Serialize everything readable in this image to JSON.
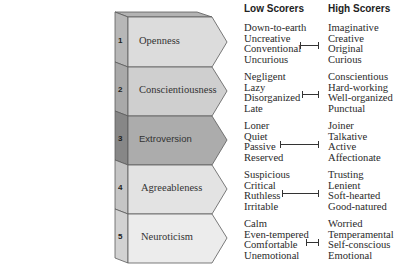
{
  "headers": {
    "low": "Low Scorers",
    "high": "High Scorers"
  },
  "traits": [
    {
      "number": "1",
      "name": "Openness",
      "fill": "#dcdcdc",
      "side": "#b7b7b7",
      "low": [
        "Down-to-earth",
        "Uncreative",
        "Conventional",
        "Uncurious"
      ],
      "high": [
        "Imaginative",
        "Creative",
        "Original",
        "Curious"
      ]
    },
    {
      "number": "2",
      "name": "Conscientiousness",
      "fill": "#cfcfcf",
      "side": "#a9a9a9",
      "low": [
        "Negligent",
        "Lazy",
        "Disorganized",
        "Late"
      ],
      "high": [
        "Conscientious",
        "Hard-working",
        "Well-organized",
        "Punctual"
      ]
    },
    {
      "number": "3",
      "name": "Extroversion",
      "fill": "#acacac",
      "side": "#878787",
      "low": [
        "Loner",
        "Quiet",
        "Passive",
        "Reserved"
      ],
      "high": [
        "Joiner",
        "Talkative",
        "Active",
        "Affectionate"
      ]
    },
    {
      "number": "4",
      "name": "Agreeableness",
      "fill": "#e3e3e3",
      "side": "#c5c5c5",
      "low": [
        "Suspicious",
        "Critical",
        "Ruthless",
        "Irritable"
      ],
      "high": [
        "Trusting",
        "Lenient",
        "Soft-hearted",
        "Good-natured"
      ]
    },
    {
      "number": "5",
      "name": "Neuroticism",
      "fill": "#ececec",
      "side": "#d2d2d2",
      "low": [
        "Calm",
        "Even-tempered",
        "Comfortable",
        "Unemotional"
      ],
      "high": [
        "Worried",
        "Temperamental",
        "Self-conscious",
        "Emotional"
      ]
    }
  ],
  "colors": {
    "top_face": "#b3b3b3",
    "outline": "#5a5a5a",
    "text": "#2a2a2a"
  }
}
